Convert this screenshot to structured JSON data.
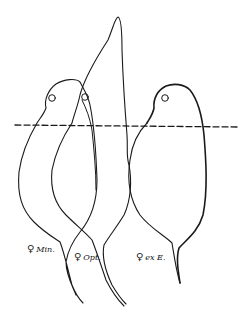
{
  "figure": {
    "labels": [
      {
        "symbol": "♀",
        "text": "Min."
      },
      {
        "symbol": "♀",
        "text": "Opt."
      },
      {
        "symbol": "♀",
        "text": "ex E."
      }
    ],
    "reference_line": "dashed horizontal"
  }
}
